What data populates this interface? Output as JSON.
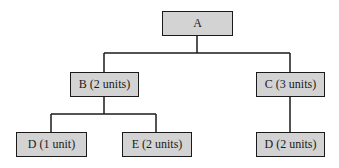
{
  "diagram": {
    "type": "tree",
    "colors": {
      "node_fill": "#d3d3d3",
      "stroke": "#1a1a1a",
      "background": "#ffffff"
    },
    "nodes": [
      {
        "id": "A",
        "label": "A",
        "level": 0
      },
      {
        "id": "B",
        "label": "B (2 units)",
        "level": 1,
        "parent": "A"
      },
      {
        "id": "C",
        "label": "C (3 units)",
        "level": 1,
        "parent": "A"
      },
      {
        "id": "D1",
        "label": "D (1 unit)",
        "level": 2,
        "parent": "B"
      },
      {
        "id": "E",
        "label": "E (2 units)",
        "level": 2,
        "parent": "B"
      },
      {
        "id": "D2",
        "label": "D (2 units)",
        "level": 2,
        "parent": "C"
      }
    ]
  }
}
